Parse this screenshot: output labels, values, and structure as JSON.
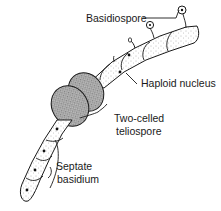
{
  "diagram": {
    "labels": {
      "basidiospore": "Basidiospore",
      "haploid_nucleus": "Haploid nucleus",
      "teliospore_line1": "Two-celled",
      "teliospore_line2": "teliospore",
      "basidium_line1": "Septate",
      "basidium_line2": "basidium"
    },
    "colors": {
      "ink": "#1a1a1a",
      "stipple": "#555555",
      "spore_fill": "#6a6a6a",
      "background": "#ffffff"
    }
  }
}
